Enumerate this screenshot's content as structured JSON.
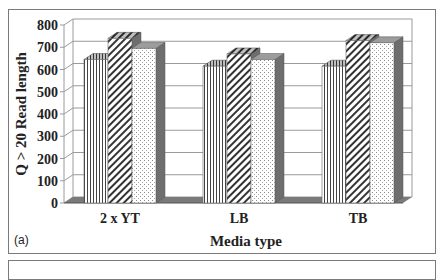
{
  "panel_label": "(a)",
  "chart_data": {
    "type": "bar",
    "style": "3d-clustered-column, patterned fills",
    "title": "",
    "xlabel": "Media type",
    "ylabel": "Q > 20 Read length",
    "ylim": [
      0,
      800
    ],
    "yticks": [
      0,
      100,
      200,
      300,
      400,
      500,
      600,
      700,
      800
    ],
    "grid": true,
    "legend": "none visible",
    "categories": [
      "2 x YT",
      "LB",
      "TB"
    ],
    "series": [
      {
        "name": "series-1 (vertical stripes)",
        "pattern": "vertical-lines",
        "values": [
          645,
          615,
          615
        ]
      },
      {
        "name": "series-2 (diagonal hatch)",
        "pattern": "diagonal-lines",
        "values": [
          740,
          670,
          730
        ]
      },
      {
        "name": "series-3 (dotted)",
        "pattern": "dots",
        "values": [
          695,
          645,
          720
        ]
      }
    ]
  },
  "colors": {
    "frame": "#7a7a7a",
    "grid": "#9a9a9a",
    "pattern_ink": "#333333",
    "side_shade": "#6e6e6e",
    "top_shade": "#9c9c9c",
    "floor": "#7a7a7a"
  }
}
